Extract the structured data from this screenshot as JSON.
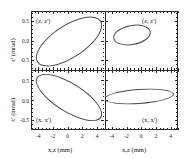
{
  "figure": {
    "type": "phase-space-ellipse-grid",
    "rows": 2,
    "cols": 2,
    "xlabel": "x,z  (mm)",
    "xlim": [
      -5,
      5
    ],
    "xticks": [
      -4,
      -2,
      0,
      2,
      4
    ],
    "xticklabels": [
      "-4",
      "-2",
      "0",
      "2",
      "4"
    ],
    "ylim": [
      -0.75,
      0.75
    ],
    "yticks": [
      -0.5,
      0.0,
      0.5
    ],
    "yticklabels": [
      "-0.5",
      "0.0",
      "0.5"
    ],
    "ytitle_top": "z' (mrad)",
    "ytitle_bottom": "x' (mrad)",
    "line_color": "#4a4a4a",
    "axis_color": "#2b2b2b",
    "background": "#ffffff"
  },
  "chart_data": {
    "type": "scatter",
    "title": "",
    "xlabel": "x,z  (mm)",
    "ylabel": "x' , z'  (mrad)",
    "xlim": [
      -5,
      5
    ],
    "ylim": [
      -0.75,
      0.75
    ],
    "grid": false,
    "legend": "none",
    "panels": [
      {
        "id": "top-left",
        "label": "(z, z')",
        "ylabel": "z' (mrad)",
        "ellipse": {
          "center_x": 0.0,
          "center_y": 0.0,
          "semi_major_mm": 4.6,
          "semi_minor_mm": 0.9,
          "tilt_deg": 33,
          "orientation": "positive-correlation",
          "x_extent": [
            -4.1,
            4.1
          ],
          "y_extent": [
            -0.6,
            0.58
          ]
        }
      },
      {
        "id": "top-right",
        "label": "(z, z')",
        "ylabel": "z' (mrad)",
        "ellipse": {
          "center_x": -1.1,
          "center_y": 0.05,
          "semi_major_mm": 2.4,
          "semi_minor_mm": 1.1,
          "tilt_deg": 10,
          "orientation": "weak-positive-correlation",
          "x_extent": [
            -3.5,
            1.4
          ],
          "y_extent": [
            -0.23,
            0.32
          ]
        }
      },
      {
        "id": "bottom-left",
        "label": "(x, x')",
        "ylabel": "x' (mrad)",
        "ellipse": {
          "center_x": 0.0,
          "center_y": 0.05,
          "semi_major_mm": 4.6,
          "semi_minor_mm": 0.75,
          "tilt_deg": -32,
          "orientation": "negative-correlation",
          "x_extent": [
            -4.2,
            4.3
          ],
          "y_extent": [
            -0.52,
            0.62
          ]
        }
      },
      {
        "id": "bottom-right",
        "label": "(x, x')",
        "ylabel": "x' (mrad)",
        "ellipse": {
          "center_x": 0.1,
          "center_y": 0.02,
          "semi_major_mm": 4.6,
          "semi_minor_mm": 0.45,
          "tilt_deg": 4,
          "orientation": "near-upright-flat",
          "x_extent": [
            -4.5,
            4.6
          ],
          "y_extent": [
            -0.18,
            0.22
          ]
        }
      }
    ]
  },
  "axes": {
    "x_tick_labels": [
      "-4",
      "-2",
      "0",
      "2",
      "4"
    ],
    "y_tick_labels": [
      "0.5",
      "0.0",
      "-0.5"
    ],
    "x_axis_title_left": "x,z  (mm)",
    "x_axis_title_right": "x,z  (mm)",
    "y_axis_title_top": "z' (mrad)",
    "y_axis_title_bottom": "x' (mrad)"
  },
  "panel_labels": {
    "top_left": "(z, z')",
    "top_right": "(z, z')",
    "bottom_left": "(x, x')",
    "bottom_right": "(x, x')"
  }
}
